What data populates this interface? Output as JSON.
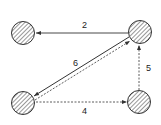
{
  "diagram": {
    "type": "directed-graph",
    "colors": {
      "stroke": "#333333",
      "hatch": "#444444",
      "background": "#ffffff"
    },
    "nodes": [
      {
        "id": "top-left",
        "cx": 23,
        "cy": 33,
        "r": 11.5,
        "style": "hatched"
      },
      {
        "id": "top-right",
        "cx": 140,
        "cy": 32,
        "r": 11.5,
        "style": "hatched"
      },
      {
        "id": "bottom-left",
        "cx": 23,
        "cy": 103,
        "r": 11.5,
        "style": "hatched"
      },
      {
        "id": "bottom-right",
        "cx": 139,
        "cy": 102,
        "r": 11.5,
        "style": "hatched"
      }
    ],
    "edges": [
      {
        "from": "top-right",
        "to": "top-left",
        "style": "solid",
        "label": "2"
      },
      {
        "from": "top-right",
        "to": "bottom-left",
        "style": "solid",
        "label": "6"
      },
      {
        "from": "bottom-left",
        "to": "top-right",
        "style": "dashed",
        "label": ""
      },
      {
        "from": "bottom-right",
        "to": "top-right",
        "style": "dashed",
        "label": "5"
      },
      {
        "from": "bottom-left",
        "to": "bottom-right",
        "style": "dashed",
        "label": "4"
      }
    ],
    "labels": {
      "edge_2": "2",
      "edge_6": "6",
      "edge_5": "5",
      "edge_4": "4"
    }
  }
}
